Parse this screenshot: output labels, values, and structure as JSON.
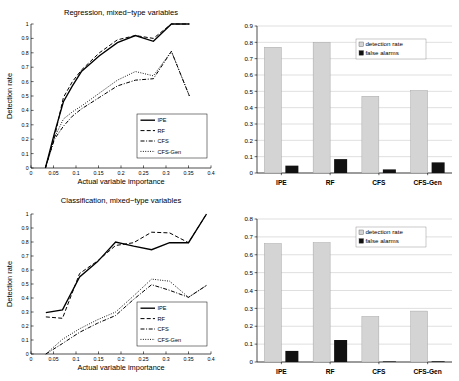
{
  "figure": {
    "background": "#ffffff",
    "width": 459,
    "height": 381
  },
  "colors": {
    "line": "#000000",
    "detection_bar": "#d4d4d4",
    "false_alarm_bar": "#111111",
    "grid": "#bfbfbf",
    "axis": "#000000"
  },
  "panels": {
    "top_left": {
      "name": "regression-line-chart",
      "title": "Regression, mixed−type variables",
      "xlabel": "Actual variable importance",
      "ylabel": "Detection rate"
    },
    "top_right": {
      "name": "regression-bar-chart"
    },
    "bottom_left": {
      "name": "classification-line-chart",
      "title": "Classification, mixed−type variables",
      "xlabel": "Actual variable importance",
      "ylabel": "Detection rate"
    },
    "bottom_right": {
      "name": "classification-bar-chart"
    }
  },
  "chart_data": [
    {
      "id": "regression-line",
      "type": "line",
      "title": "Regression, mixed−type variables",
      "xlabel": "Actual variable importance",
      "ylabel": "Detection rate",
      "xlim": [
        0,
        0.4
      ],
      "ylim": [
        0,
        1
      ],
      "xticks": [
        0,
        0.05,
        0.1,
        0.15,
        0.2,
        0.25,
        0.3,
        0.35,
        0.4
      ],
      "xticklabels": [
        "0",
        "0.05",
        "0.1",
        "0.15",
        "0.2",
        "0.25",
        "0.3",
        "0.35",
        "0.4"
      ],
      "yticks": [
        0,
        0.1,
        0.2,
        0.3,
        0.4,
        0.5,
        0.6,
        0.7,
        0.8,
        0.9,
        1
      ],
      "yticklabels": [
        "0",
        "0.1",
        "0.2",
        "0.3",
        "0.4",
        "0.5",
        "0.6",
        "0.7",
        "0.8",
        "0.9",
        "1"
      ],
      "grid": false,
      "legend_position": "lower right",
      "series": [
        {
          "name": "IPE",
          "style": "solid",
          "x": [
            0.032,
            0.052,
            0.072,
            0.092,
            0.112,
            0.152,
            0.192,
            0.232,
            0.272,
            0.312,
            0.352
          ],
          "y": [
            0.0,
            0.24,
            0.46,
            0.57,
            0.67,
            0.78,
            0.87,
            0.92,
            0.88,
            1.0,
            1.0
          ]
        },
        {
          "name": "RF",
          "style": "dashed",
          "x": [
            0.032,
            0.052,
            0.072,
            0.092,
            0.112,
            0.152,
            0.192,
            0.232,
            0.272,
            0.312,
            0.352
          ],
          "y": [
            0.0,
            0.21,
            0.49,
            0.6,
            0.68,
            0.8,
            0.89,
            0.92,
            0.9,
            1.0,
            1.0
          ]
        },
        {
          "name": "CFS",
          "style": "dashdot",
          "x": [
            0.032,
            0.052,
            0.072,
            0.092,
            0.112,
            0.152,
            0.192,
            0.232,
            0.272,
            0.312,
            0.352
          ],
          "y": [
            0.0,
            0.2,
            0.29,
            0.36,
            0.41,
            0.49,
            0.57,
            0.61,
            0.62,
            0.81,
            0.5
          ]
        },
        {
          "name": "CFS-Gen",
          "style": "dotted",
          "x": [
            0.032,
            0.052,
            0.072,
            0.092,
            0.112,
            0.152,
            0.192,
            0.232,
            0.272,
            0.312,
            0.352
          ],
          "y": [
            0.0,
            0.21,
            0.34,
            0.39,
            0.43,
            0.52,
            0.61,
            0.67,
            0.64,
            0.81,
            0.5
          ]
        }
      ]
    },
    {
      "id": "regression-bar",
      "type": "bar",
      "categories": [
        "IPE",
        "RF",
        "CFS",
        "CFS-Gen"
      ],
      "ylim": [
        0,
        0.9
      ],
      "yticks": [
        0,
        0.1,
        0.2,
        0.3,
        0.4,
        0.5,
        0.6,
        0.7,
        0.8,
        0.9
      ],
      "yticklabels": [
        "0",
        "0.1",
        "0.2",
        "0.3",
        "0.4",
        "0.5",
        "0.6",
        "0.7",
        "0.8",
        "0.9"
      ],
      "grid": true,
      "legend_position": "upper right",
      "series": [
        {
          "name": "detection rate",
          "color": "#d4d4d4",
          "values": [
            0.77,
            0.8,
            0.47,
            0.505
          ]
        },
        {
          "name": "false alarms",
          "color": "#111111",
          "values": [
            0.045,
            0.085,
            0.022,
            0.065
          ]
        }
      ]
    },
    {
      "id": "classification-line",
      "type": "line",
      "title": "Classification, mixed−type variables",
      "xlabel": "Actual variable importance",
      "ylabel": "Detection rate",
      "xlim": [
        0,
        0.4
      ],
      "ylim": [
        0,
        1
      ],
      "xticks": [
        0,
        0.05,
        0.1,
        0.15,
        0.2,
        0.25,
        0.3,
        0.35,
        0.4
      ],
      "xticklabels": [
        "0",
        "0.05",
        "0.1",
        "0.15",
        "0.2",
        "0.25",
        "0.3",
        "0.35",
        "0.4"
      ],
      "yticks": [
        0,
        0.1,
        0.2,
        0.3,
        0.4,
        0.5,
        0.6,
        0.7,
        0.8,
        0.9,
        1
      ],
      "yticklabels": [
        "0",
        "0.1",
        "0.2",
        "0.3",
        "0.4",
        "0.5",
        "0.6",
        "0.7",
        "0.8",
        "0.9",
        "1"
      ],
      "grid": false,
      "legend_position": "lower right",
      "series": [
        {
          "name": "IPE",
          "style": "solid",
          "x": [
            0.033,
            0.07,
            0.108,
            0.148,
            0.188,
            0.228,
            0.268,
            0.308,
            0.35,
            0.39
          ],
          "y": [
            0.295,
            0.315,
            0.55,
            0.66,
            0.8,
            0.77,
            0.745,
            0.795,
            0.795,
            1.0
          ]
        },
        {
          "name": "RF",
          "style": "dashed",
          "x": [
            0.033,
            0.07,
            0.108,
            0.148,
            0.188,
            0.228,
            0.268,
            0.308,
            0.35,
            0.39
          ],
          "y": [
            0.265,
            0.255,
            0.575,
            0.665,
            0.775,
            0.795,
            0.87,
            0.865,
            0.795,
            1.0
          ]
        },
        {
          "name": "CFS",
          "style": "dashdot",
          "x": [
            0.033,
            0.07,
            0.108,
            0.148,
            0.188,
            0.228,
            0.268,
            0.308,
            0.35,
            0.39
          ],
          "y": [
            0.0,
            0.075,
            0.155,
            0.22,
            0.275,
            0.39,
            0.495,
            0.455,
            0.405,
            0.49
          ]
        },
        {
          "name": "CFS-Gen",
          "style": "dotted",
          "x": [
            0.033,
            0.07,
            0.108,
            0.148,
            0.188,
            0.228,
            0.268,
            0.308,
            0.35,
            0.39
          ],
          "y": [
            0.0,
            0.105,
            0.18,
            0.245,
            0.3,
            0.415,
            0.535,
            0.52,
            0.405,
            0.49
          ]
        }
      ]
    },
    {
      "id": "classification-bar",
      "type": "bar",
      "categories": [
        "IPE",
        "RF",
        "CFS",
        "CFS-Gen"
      ],
      "ylim": [
        0,
        0.8
      ],
      "yticks": [
        0,
        0.1,
        0.2,
        0.3,
        0.4,
        0.5,
        0.6,
        0.7,
        0.8
      ],
      "yticklabels": [
        "0",
        "0.1",
        "0.2",
        "0.3",
        "0.4",
        "0.5",
        "0.6",
        "0.7",
        "0.8"
      ],
      "grid": true,
      "legend_position": "upper right",
      "series": [
        {
          "name": "detection rate",
          "color": "#d4d4d4",
          "values": [
            0.663,
            0.668,
            0.255,
            0.285
          ]
        },
        {
          "name": "false alarms",
          "color": "#111111",
          "values": [
            0.062,
            0.123,
            0.0,
            0.004
          ]
        }
      ]
    }
  ]
}
